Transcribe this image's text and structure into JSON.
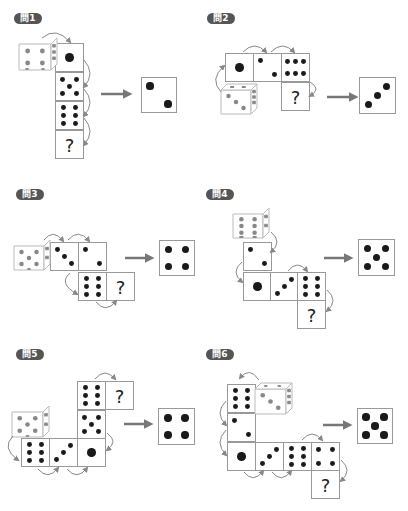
{
  "colors": {
    "label_bg": "#555555",
    "pip": "#1a1a1a",
    "pip_3d": "#888888",
    "face_border": "#999999",
    "arrow": "#777777",
    "curve": "#888888"
  },
  "problems": [
    {
      "label": "問1",
      "label_pos": [
        14,
        13
      ],
      "die3d": {
        "x": 19,
        "y": 38,
        "size": 32,
        "front": 4,
        "side": 6,
        "bottom": 2
      },
      "faces": [
        {
          "x": 55,
          "y": 43,
          "value": 1
        },
        {
          "x": 55,
          "y": 72,
          "value": 5
        },
        {
          "x": 55,
          "y": 101,
          "value": 6
        },
        {
          "x": 55,
          "y": 130,
          "value": "?"
        }
      ],
      "curves": [
        {
          "x1": 42,
          "y1": 38,
          "x2": 70,
          "y2": 42,
          "dir": "top"
        },
        {
          "x1": 84,
          "y1": 60,
          "x2": 84,
          "y2": 87,
          "dir": "right"
        },
        {
          "x1": 84,
          "y1": 89,
          "x2": 84,
          "y2": 116,
          "dir": "right"
        },
        {
          "x1": 84,
          "y1": 118,
          "x2": 84,
          "y2": 145,
          "dir": "right"
        }
      ],
      "arrow": {
        "x": 101,
        "y": 94,
        "len": 30
      },
      "answer": {
        "x": 141,
        "y": 77,
        "size": 36,
        "value": 2
      }
    },
    {
      "label": "問2",
      "label_pos": [
        207,
        13
      ],
      "die3d": {
        "x": 221,
        "y": 84,
        "size": 30,
        "front": 3,
        "side": 6,
        "top": 6
      },
      "faces": [
        {
          "x": 225,
          "y": 53,
          "value": 1
        },
        {
          "x": 253,
          "y": 53,
          "value": 2
        },
        {
          "x": 281,
          "y": 53,
          "value": 6,
          "rot": true
        },
        {
          "x": 281,
          "y": 82,
          "value": "?"
        }
      ],
      "curves": [
        {
          "x1": 243,
          "y1": 52,
          "x2": 266,
          "y2": 52,
          "dir": "top"
        },
        {
          "x1": 271,
          "y1": 52,
          "x2": 294,
          "y2": 52,
          "dir": "top"
        },
        {
          "x1": 221,
          "y1": 92,
          "x2": 224,
          "y2": 66,
          "dir": "left"
        },
        {
          "x1": 310,
          "y1": 82,
          "x2": 310,
          "y2": 96,
          "dir": "right"
        }
      ],
      "arrow": {
        "x": 327,
        "y": 97,
        "len": 30
      },
      "answer": {
        "x": 359,
        "y": 77,
        "size": 37,
        "value": 3
      }
    },
    {
      "label": "問3",
      "label_pos": [
        16,
        189
      ],
      "die3d": {
        "x": 14,
        "y": 240,
        "size": 30,
        "front": 5,
        "side": 4,
        "bottom": 1
      },
      "faces": [
        {
          "x": 50,
          "y": 242,
          "value": 3,
          "diag": "down"
        },
        {
          "x": 78,
          "y": 242,
          "value": 2
        },
        {
          "x": 78,
          "y": 272,
          "value": 6
        },
        {
          "x": 106,
          "y": 272,
          "value": "?"
        }
      ],
      "curves": [
        {
          "x1": 44,
          "y1": 240,
          "x2": 63,
          "y2": 241,
          "dir": "top"
        },
        {
          "x1": 68,
          "y1": 240,
          "x2": 89,
          "y2": 241,
          "dir": "top"
        },
        {
          "x1": 70,
          "y1": 273,
          "x2": 77,
          "y2": 294,
          "dir": "left"
        },
        {
          "x1": 96,
          "y1": 302,
          "x2": 116,
          "y2": 301,
          "dir": "bottom"
        }
      ],
      "arrow": {
        "x": 125,
        "y": 258,
        "len": 28
      },
      "answer": {
        "x": 159,
        "y": 240,
        "size": 36,
        "value": 4
      }
    },
    {
      "label": "問4",
      "label_pos": [
        206,
        189
      ],
      "die3d": {
        "x": 233,
        "y": 208,
        "size": 30,
        "front": 6,
        "side": 4,
        "bottom": 6
      },
      "faces": [
        {
          "x": 243,
          "y": 242,
          "value": 2
        },
        {
          "x": 243,
          "y": 272,
          "value": 1
        },
        {
          "x": 270,
          "y": 272,
          "value": 3
        },
        {
          "x": 297,
          "y": 272,
          "value": 6
        },
        {
          "x": 297,
          "y": 300,
          "value": "?"
        }
      ],
      "curves": [
        {
          "x1": 271,
          "y1": 232,
          "x2": 271,
          "y2": 252,
          "dir": "right"
        },
        {
          "x1": 242,
          "y1": 262,
          "x2": 242,
          "y2": 282,
          "dir": "left"
        },
        {
          "x1": 288,
          "y1": 271,
          "x2": 307,
          "y2": 271,
          "dir": "top"
        },
        {
          "x1": 327,
          "y1": 290,
          "x2": 327,
          "y2": 311,
          "dir": "right"
        }
      ],
      "arrow": {
        "x": 324,
        "y": 258,
        "len": 28
      },
      "answer": {
        "x": 358,
        "y": 239,
        "size": 37,
        "value": 5
      }
    },
    {
      "label": "問5",
      "label_pos": [
        16,
        349
      ],
      "die3d": {
        "x": 12,
        "y": 406,
        "size": 31,
        "front": 5,
        "side": 4,
        "bottom": 1
      },
      "faces": [
        {
          "x": 77,
          "y": 381,
          "value": 6
        },
        {
          "x": 105,
          "y": 381,
          "value": "?"
        },
        {
          "x": 77,
          "y": 410,
          "value": 5
        },
        {
          "x": 21,
          "y": 438,
          "value": 6
        },
        {
          "x": 49,
          "y": 438,
          "value": 3
        },
        {
          "x": 77,
          "y": 438,
          "value": 1
        }
      ],
      "curves": [
        {
          "x1": 95,
          "y1": 379,
          "x2": 115,
          "y2": 379,
          "dir": "top"
        },
        {
          "x1": 107,
          "y1": 433,
          "x2": 107,
          "y2": 450,
          "dir": "right"
        },
        {
          "x1": 13,
          "y1": 436,
          "x2": 18,
          "y2": 460,
          "dir": "left"
        },
        {
          "x1": 38,
          "y1": 469,
          "x2": 58,
          "y2": 468,
          "dir": "bottom"
        },
        {
          "x1": 67,
          "y1": 469,
          "x2": 87,
          "y2": 468,
          "dir": "bottom"
        }
      ],
      "arrow": {
        "x": 124,
        "y": 424,
        "len": 28
      },
      "answer": {
        "x": 158,
        "y": 408,
        "size": 37,
        "value": 4
      }
    },
    {
      "label": "問6",
      "label_pos": [
        206,
        349
      ],
      "die3d": {
        "x": 255,
        "y": 383,
        "size": 31,
        "front": 3,
        "side": 6,
        "top": 2
      },
      "faces": [
        {
          "x": 227,
          "y": 384,
          "value": 6
        },
        {
          "x": 227,
          "y": 413,
          "value": 2
        },
        {
          "x": 227,
          "y": 442,
          "value": 1
        },
        {
          "x": 255,
          "y": 442,
          "value": 3
        },
        {
          "x": 283,
          "y": 442,
          "value": 6
        },
        {
          "x": 311,
          "y": 442,
          "value": 4
        },
        {
          "x": 311,
          "y": 470,
          "value": "?"
        }
      ],
      "curves": [
        {
          "x1": 259,
          "y1": 380,
          "x2": 240,
          "y2": 378,
          "dir": "top"
        },
        {
          "x1": 226,
          "y1": 401,
          "x2": 226,
          "y2": 425,
          "dir": "left"
        },
        {
          "x1": 226,
          "y1": 430,
          "x2": 226,
          "y2": 455,
          "dir": "left"
        },
        {
          "x1": 244,
          "y1": 472,
          "x2": 263,
          "y2": 471,
          "dir": "bottom"
        },
        {
          "x1": 272,
          "y1": 472,
          "x2": 291,
          "y2": 471,
          "dir": "bottom"
        },
        {
          "x1": 302,
          "y1": 440,
          "x2": 322,
          "y2": 440,
          "dir": "top"
        },
        {
          "x1": 341,
          "y1": 460,
          "x2": 341,
          "y2": 481,
          "dir": "right"
        }
      ],
      "arrow": {
        "x": 323,
        "y": 425,
        "len": 28
      },
      "answer": {
        "x": 357,
        "y": 408,
        "size": 36,
        "value": 5
      }
    }
  ]
}
